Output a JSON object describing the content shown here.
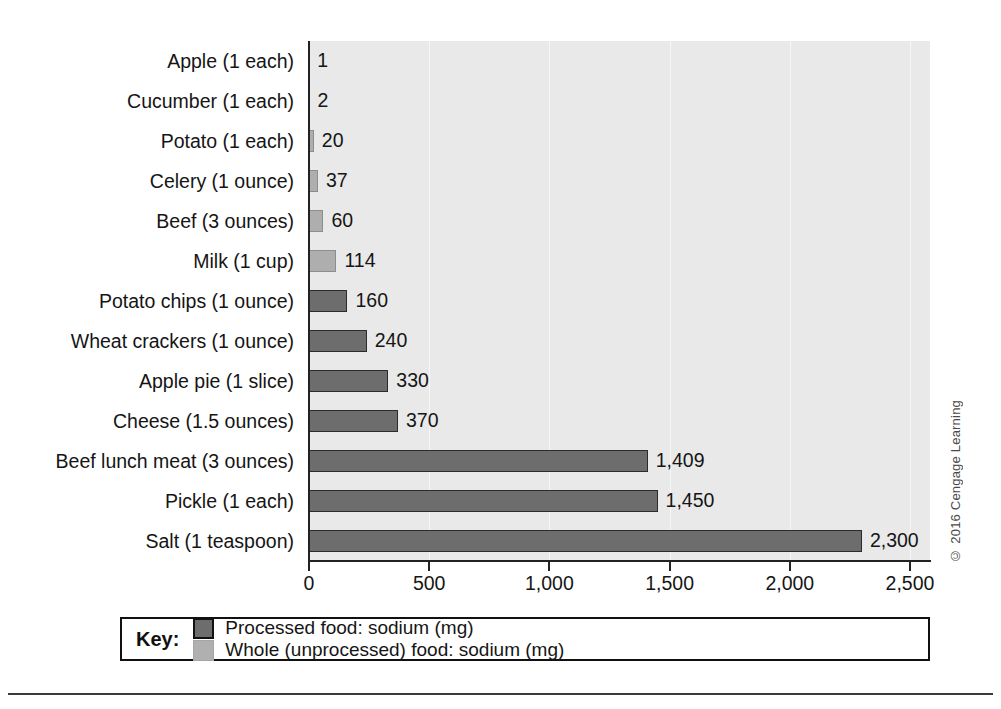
{
  "chart_data": {
    "type": "bar",
    "orientation": "horizontal",
    "title": "",
    "xlabel": "",
    "ylabel": "",
    "xlim": [
      0,
      2500
    ],
    "xticks": [
      0,
      500,
      1000,
      1500,
      2000,
      2500
    ],
    "xtick_labels": [
      "0",
      "500",
      "1,000",
      "1,500",
      "2,000",
      "2,500"
    ],
    "grid": true,
    "legend_position": "bottom",
    "categories": [
      "Apple (1 each)",
      "Cucumber (1 each)",
      "Potato (1 each)",
      "Celery (1 ounce)",
      "Beef (3 ounces)",
      "Milk (1 cup)",
      "Potato chips (1 ounce)",
      "Wheat crackers (1 ounce)",
      "Apple pie (1 slice)",
      "Cheese (1.5 ounces)",
      "Beef lunch meat (3 ounces)",
      "Pickle (1 each)",
      "Salt (1 teaspoon)"
    ],
    "values": [
      1,
      2,
      20,
      37,
      60,
      114,
      160,
      240,
      330,
      370,
      1409,
      1450,
      2300
    ],
    "value_labels": [
      "1",
      "2",
      "20",
      "37",
      "60",
      "114",
      "160",
      "240",
      "330",
      "370",
      "1,409",
      "1,450",
      "2,300"
    ],
    "series_of_point": [
      "whole",
      "whole",
      "whole",
      "whole",
      "whole",
      "whole",
      "processed",
      "processed",
      "processed",
      "processed",
      "processed",
      "processed",
      "processed"
    ],
    "series": [
      {
        "name": "Processed food: sodium (mg)",
        "key": "processed",
        "color": "#6d6d6d"
      },
      {
        "name": "Whole (unprocessed) food: sodium (mg)",
        "key": "whole",
        "color": "#b0b0b0"
      }
    ]
  },
  "legend": {
    "key_label": "Key:",
    "entries": [
      {
        "label": "Processed food: sodium (mg)",
        "swatch": "processed"
      },
      {
        "label": "Whole (unprocessed) food: sodium (mg)",
        "swatch": "whole"
      }
    ]
  },
  "credit": {
    "text": "© 2016 Cengage Learning"
  },
  "colors": {
    "processed": "#6d6d6d",
    "whole": "#b0b0b0",
    "plot_background": "#e9e9e9",
    "axis": "#222222",
    "page_background": "#ffffff"
  }
}
